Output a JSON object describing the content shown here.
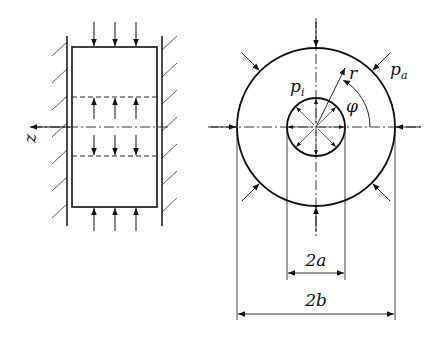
{
  "figure": {
    "left_view": {
      "axis_label": "z",
      "description": "Cylinder between rigid walls with axial pressure loads"
    },
    "right_view": {
      "inner_pressure_label": "p",
      "inner_pressure_sub": "i",
      "outer_pressure_label": "p",
      "outer_pressure_sub": "a",
      "radius_label": "r",
      "angle_label": "φ",
      "inner_dimension_label": "2a",
      "outer_dimension_label": "2b"
    },
    "colors": {
      "ink": "#111111",
      "background": "#ffffff"
    }
  }
}
